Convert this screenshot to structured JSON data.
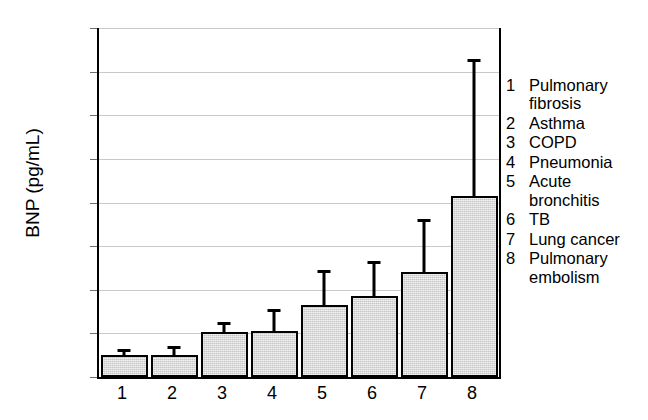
{
  "chart_data": {
    "type": "bar",
    "title": "",
    "xlabel": "",
    "ylabel": "BNP (pg/mL)",
    "ylim": [
      0,
      400
    ],
    "ytick_values": [
      0,
      50,
      100,
      150,
      200,
      250,
      300,
      350,
      400
    ],
    "ytick_labels": [
      "0",
      "50",
      "100",
      "150",
      "200",
      "250",
      "300",
      "350",
      "400"
    ],
    "grid": true,
    "legend_position": "right",
    "categories": [
      "1",
      "2",
      "3",
      "4",
      "5",
      "6",
      "7",
      "8"
    ],
    "category_names": [
      "Pulmonary fibrosis",
      "Asthma",
      "COPD",
      "Pneumonia",
      "Acute bronchitis",
      "TB",
      "Lung cancer",
      "Pulmonary embolism"
    ],
    "values": [
      25,
      25,
      52,
      53,
      83,
      93,
      120,
      208
    ],
    "error_upper": [
      32,
      36,
      63,
      78,
      123,
      133,
      181,
      364
    ],
    "bar_color": "#c6c6c6",
    "bar_edge_color": "#000000",
    "error_color": "#000000",
    "grid_color": "#c9c9c9"
  },
  "axis": {
    "y_title": "BNP (pg/mL)",
    "y_ticks": [
      {
        "label": "400",
        "value": 400
      },
      {
        "label": "350",
        "value": 350
      },
      {
        "label": "300",
        "value": 300
      },
      {
        "label": "250",
        "value": 250
      },
      {
        "label": "200",
        "value": 200
      },
      {
        "label": "150",
        "value": 150
      },
      {
        "label": "100",
        "value": 100
      },
      {
        "label": "50",
        "value": 50
      },
      {
        "label": "0",
        "value": 0
      }
    ],
    "x_ticks": [
      {
        "label": "1"
      },
      {
        "label": "2"
      },
      {
        "label": "3"
      },
      {
        "label": "4"
      },
      {
        "label": "5"
      },
      {
        "label": "6"
      },
      {
        "label": "7"
      },
      {
        "label": "8"
      }
    ]
  },
  "legend": {
    "entries": [
      {
        "number": "1",
        "label": "Pulmonary\nfibrosis"
      },
      {
        "number": "2",
        "label": "Asthma"
      },
      {
        "number": "3",
        "label": "COPD"
      },
      {
        "number": "4",
        "label": "Pneumonia"
      },
      {
        "number": "5",
        "label": "Acute\nbronchitis"
      },
      {
        "number": "6",
        "label": "TB"
      },
      {
        "number": "7",
        "label": "Lung cancer"
      },
      {
        "number": "8",
        "label": "Pulmonary\nembolism"
      }
    ]
  }
}
